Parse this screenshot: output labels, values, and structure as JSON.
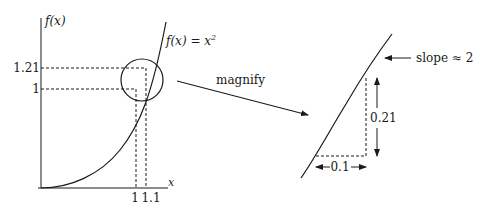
{
  "diagram": {
    "left_plot": {
      "y_axis_label": "f(x)",
      "x_axis_label": "x",
      "function_label_lhs": "f(x) = x",
      "function_label_exp": "2",
      "y_ticks": [
        "1.21",
        "1"
      ],
      "x_ticks": [
        "1",
        "1.1"
      ],
      "points": [
        {
          "x": 1,
          "y": 1
        },
        {
          "x": 1.1,
          "y": 1.21
        }
      ]
    },
    "arrow_label": "magnify",
    "right_plot": {
      "slope_label": "slope ≈ 2",
      "rise_label": "0.21",
      "run_label": "0.1"
    }
  }
}
